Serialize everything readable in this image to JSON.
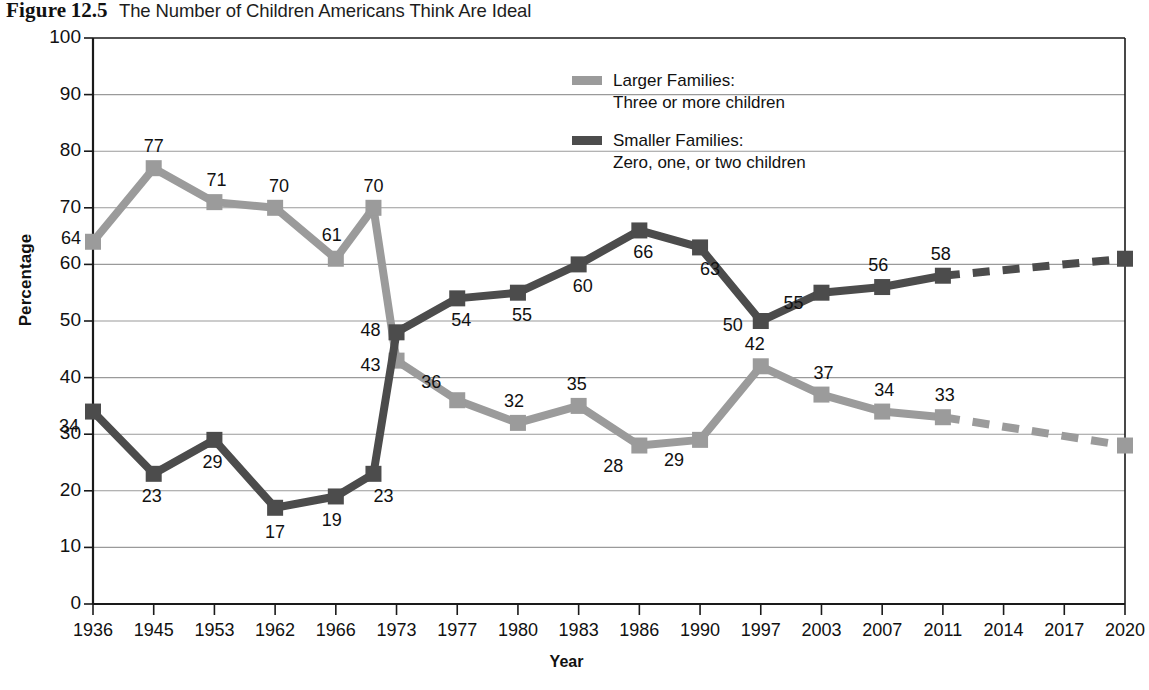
{
  "figure": {
    "label": "Figure",
    "number": "12.5",
    "title": "The Number of Children Americans Think Are Ideal"
  },
  "axes": {
    "ylabel": "Percentage",
    "xlabel": "Year",
    "yticks": [
      "0",
      "10",
      "20",
      "30",
      "40",
      "50",
      "60",
      "70",
      "80",
      "90",
      "100"
    ]
  },
  "legend": {
    "items": [
      {
        "name": "Larger Families",
        "line1": "Larger Families:",
        "line2": "Three or more children",
        "color": "#9b9b9b"
      },
      {
        "name": "Smaller Families",
        "line1": "Smaller Families:",
        "line2": "Zero, one, or two children",
        "color": "#4c4c4c"
      }
    ]
  },
  "colors": {
    "larger": "#9b9b9b",
    "smaller": "#4c4c4c",
    "grid": "#9a9a9a",
    "axis": "#1a1a1a"
  },
  "chart_data": {
    "type": "line",
    "title": "Figure 12.5 The Number of Children Americans Think Are Ideal",
    "xlabel": "Year",
    "ylabel": "Percentage",
    "ylim": [
      0,
      100
    ],
    "ytick_step": 10,
    "grid": true,
    "legend_position": "upper-center",
    "categories": [
      "1936",
      "1945",
      "1953",
      "1962",
      "1966",
      "1973",
      "1977",
      "1980",
      "1983",
      "1986",
      "1990",
      "1997",
      "2003",
      "2007",
      "2011",
      "2014",
      "2017",
      "2020"
    ],
    "note": "An unlabeled interior point falls between the 1966 and 1973 ticks (values 70 larger / 23 smaller); segments after 2011 are drawn dashed (projected) through 2014 and 2017 to the 2020 endpoint.",
    "series": [
      {
        "name": "Larger Families: Three or more children",
        "color": "#9b9b9b",
        "points": [
          {
            "x": "1936",
            "value": 64,
            "label": "64",
            "dashed_to_next": false
          },
          {
            "x": "1945",
            "value": 77,
            "label": "77",
            "dashed_to_next": false
          },
          {
            "x": "1953",
            "value": 71,
            "label": "71",
            "dashed_to_next": false
          },
          {
            "x": "1962",
            "value": 70,
            "label": "70",
            "dashed_to_next": false
          },
          {
            "x": "1966",
            "value": 61,
            "label": "61",
            "dashed_to_next": false
          },
          {
            "x": "1969",
            "value": 70,
            "label": "70",
            "dashed_to_next": false
          },
          {
            "x": "1973",
            "value": 43,
            "label": "43",
            "dashed_to_next": false
          },
          {
            "x": "1977",
            "value": 36,
            "label": "36",
            "dashed_to_next": false
          },
          {
            "x": "1980",
            "value": 32,
            "label": "32",
            "dashed_to_next": false
          },
          {
            "x": "1983",
            "value": 35,
            "label": "35",
            "dashed_to_next": false
          },
          {
            "x": "1986",
            "value": 28,
            "label": "28",
            "dashed_to_next": false
          },
          {
            "x": "1990",
            "value": 29,
            "label": "29",
            "dashed_to_next": false
          },
          {
            "x": "1997",
            "value": 42,
            "label": "42",
            "dashed_to_next": false
          },
          {
            "x": "2003",
            "value": 37,
            "label": "37",
            "dashed_to_next": false
          },
          {
            "x": "2007",
            "value": 34,
            "label": "34",
            "dashed_to_next": false
          },
          {
            "x": "2011",
            "value": 33,
            "label": "33",
            "dashed_to_next": true
          },
          {
            "x": "2020",
            "value": 28,
            "label": "",
            "dashed_to_next": false
          }
        ]
      },
      {
        "name": "Smaller Families: Zero, one, or two children",
        "color": "#4c4c4c",
        "points": [
          {
            "x": "1936",
            "value": 34,
            "label": "34",
            "dashed_to_next": false
          },
          {
            "x": "1945",
            "value": 23,
            "label": "23",
            "dashed_to_next": false
          },
          {
            "x": "1953",
            "value": 29,
            "label": "29",
            "dashed_to_next": false
          },
          {
            "x": "1962",
            "value": 17,
            "label": "17",
            "dashed_to_next": false
          },
          {
            "x": "1966",
            "value": 19,
            "label": "19",
            "dashed_to_next": false
          },
          {
            "x": "1969",
            "value": 23,
            "label": "23",
            "dashed_to_next": false
          },
          {
            "x": "1973",
            "value": 48,
            "label": "48",
            "dashed_to_next": false
          },
          {
            "x": "1977",
            "value": 54,
            "label": "54",
            "dashed_to_next": false
          },
          {
            "x": "1980",
            "value": 55,
            "label": "55",
            "dashed_to_next": false
          },
          {
            "x": "1983",
            "value": 60,
            "label": "60",
            "dashed_to_next": false
          },
          {
            "x": "1986",
            "value": 66,
            "label": "66",
            "dashed_to_next": false
          },
          {
            "x": "1990",
            "value": 63,
            "label": "63",
            "dashed_to_next": false
          },
          {
            "x": "1997",
            "value": 50,
            "label": "50",
            "dashed_to_next": false
          },
          {
            "x": "2003",
            "value": 55,
            "label": "55",
            "dashed_to_next": false
          },
          {
            "x": "2007",
            "value": 56,
            "label": "56",
            "dashed_to_next": false
          },
          {
            "x": "2011",
            "value": 58,
            "label": "58",
            "dashed_to_next": true
          },
          {
            "x": "2020",
            "value": 61,
            "label": "",
            "dashed_to_next": false
          }
        ]
      }
    ],
    "label_offsets": {
      "larger": [
        [
          -22,
          -4
        ],
        [
          0,
          -22
        ],
        [
          2,
          -22
        ],
        [
          4,
          -22
        ],
        [
          -4,
          -24
        ],
        [
          0,
          -22
        ],
        [
          -26,
          4
        ],
        [
          -26,
          -18
        ],
        [
          -4,
          -22
        ],
        [
          -2,
          -22
        ],
        [
          -26,
          20
        ],
        [
          -26,
          20
        ],
        [
          -6,
          -22
        ],
        [
          2,
          -22
        ],
        [
          2,
          -22
        ],
        [
          2,
          -22
        ]
      ],
      "smaller": [
        [
          -24,
          14
        ],
        [
          -2,
          22
        ],
        [
          -2,
          22
        ],
        [
          0,
          24
        ],
        [
          -4,
          24
        ],
        [
          10,
          22
        ],
        [
          -26,
          -2
        ],
        [
          4,
          22
        ],
        [
          4,
          22
        ],
        [
          4,
          22
        ],
        [
          4,
          22
        ],
        [
          10,
          22
        ],
        [
          -28,
          4
        ],
        [
          -28,
          10
        ],
        [
          -4,
          -22
        ],
        [
          -2,
          -22
        ]
      ]
    }
  }
}
